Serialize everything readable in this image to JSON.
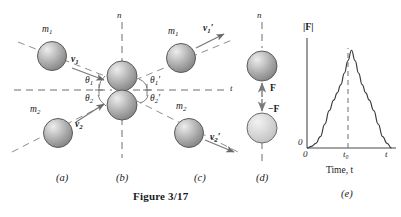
{
  "figure": {
    "caption": "Figure 3/17",
    "panels": [
      {
        "id": "a",
        "label": "(a)",
        "cx": 62,
        "caption_x": 62
      },
      {
        "id": "b",
        "label": "(b)",
        "cx": 122,
        "caption_x": 122
      },
      {
        "id": "c",
        "label": "(c)",
        "cx": 200,
        "caption_x": 200
      },
      {
        "id": "d",
        "label": "(d)",
        "cx": 262,
        "caption_x": 262
      },
      {
        "id": "e",
        "label": "(e)",
        "cx": 347,
        "caption_x": 347
      }
    ]
  },
  "axes": {
    "n_axis_left": "n",
    "n_axis_right": "n",
    "t_axis": "t"
  },
  "bodies": {
    "m1_incoming": "m",
    "m1_incoming_sub": "1",
    "m2_incoming": "m",
    "m2_incoming_sub": "2",
    "m1_outgoing": "m",
    "m1_outgoing_sub": "1",
    "m2_outgoing": "m",
    "m2_outgoing_sub": "2"
  },
  "velocities": {
    "v1": "v",
    "v1_sub": "1",
    "v1_prime": "",
    "v2": "v",
    "v2_sub": "2",
    "v2_prime": "",
    "v1p": "v",
    "v1p_sub": "1",
    "v1p_prime": "′",
    "v2p": "v",
    "v2p_sub": "2",
    "v2p_prime": "′"
  },
  "angles": {
    "theta1": "θ",
    "theta1_sub": "1",
    "theta2": "θ",
    "theta2_sub": "2",
    "theta1p": "θ",
    "theta1p_sub": "1",
    "theta1p_prime": "′",
    "theta2p": "θ",
    "theta2p_sub": "2",
    "theta2p_prime": "′"
  },
  "forces": {
    "f_up": "F",
    "f_down": "−F"
  },
  "chart_data": {
    "type": "line",
    "title": "",
    "ylabel": "|F|",
    "xlabel": "Time, t",
    "x_origin_label": "0",
    "y_origin_label": "0",
    "x_tick_labels": [
      "t₀",
      "t"
    ],
    "peak_label": "t₀",
    "axis_symbol": "t",
    "grid": false,
    "legend": false,
    "xlim": [
      0,
      10
    ],
    "ylim": [
      0,
      10
    ],
    "peak_x": 5,
    "peak_y": 9.4,
    "x": [
      0.0,
      0.5,
      1.0,
      1.5,
      2.0,
      2.5,
      3.0,
      3.4,
      3.8,
      4.2,
      4.6,
      5.0,
      5.4,
      5.8,
      6.2,
      6.6,
      7.0,
      7.5,
      8.0,
      8.5,
      9.0,
      9.5
    ],
    "values": [
      0.0,
      0.15,
      0.45,
      1.1,
      2.3,
      3.6,
      4.6,
      5.3,
      6.1,
      7.2,
      8.4,
      9.4,
      8.4,
      7.2,
      6.1,
      5.3,
      4.6,
      3.6,
      2.3,
      1.1,
      0.45,
      0.0
    ]
  },
  "colors": {
    "sphere_fill": "#b9b9b9",
    "sphere_highlight": "#e6e6e6",
    "sphere_light_fill": "#d7d7d7",
    "line": "#555555",
    "ink": "#1a1a1a",
    "curve": "#3a3a3a"
  }
}
